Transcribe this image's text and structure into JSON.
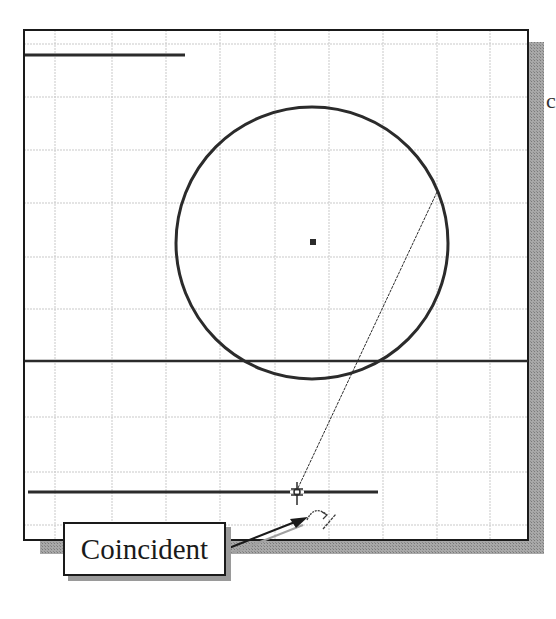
{
  "figure": {
    "type": "cad-sketch-constraint-illustration",
    "callout": {
      "label": "Coincident"
    },
    "edge_text": "c",
    "colors": {
      "background": "#ffffff",
      "frame": "#1a1a1a",
      "grid_major": "#c8c8c8",
      "grid_minor": "#e2e2e2",
      "geometry": "#2b2b2b",
      "shadow": "#9a9a9a"
    },
    "frame": {
      "x": 24,
      "y": 30,
      "width": 504,
      "height": 510
    },
    "grid": {
      "vertical_x": [
        55,
        112,
        166,
        220,
        275,
        329,
        383,
        437,
        490
      ],
      "horizontal_y": [
        44,
        97,
        150,
        203,
        257,
        309,
        417,
        472,
        525
      ]
    },
    "geometry": {
      "circle": {
        "cx": 312,
        "cy": 243,
        "r": 136
      },
      "center_point": {
        "x": 313,
        "y": 242
      },
      "lines": [
        {
          "name": "top-short-line",
          "x1": 25,
          "y1": 55,
          "x2": 185,
          "y2": 55
        },
        {
          "name": "middle-horizontal-line",
          "x1": 25,
          "y1": 361,
          "x2": 528,
          "y2": 361
        },
        {
          "name": "bottom-horizontal-line",
          "x1": 28,
          "y1": 492,
          "x2": 378,
          "y2": 492
        },
        {
          "name": "thin-inclined-line",
          "x1": 437,
          "y1": 192,
          "x2": 298,
          "y2": 488
        }
      ],
      "cursor": {
        "x": 297,
        "y": 492
      }
    }
  }
}
